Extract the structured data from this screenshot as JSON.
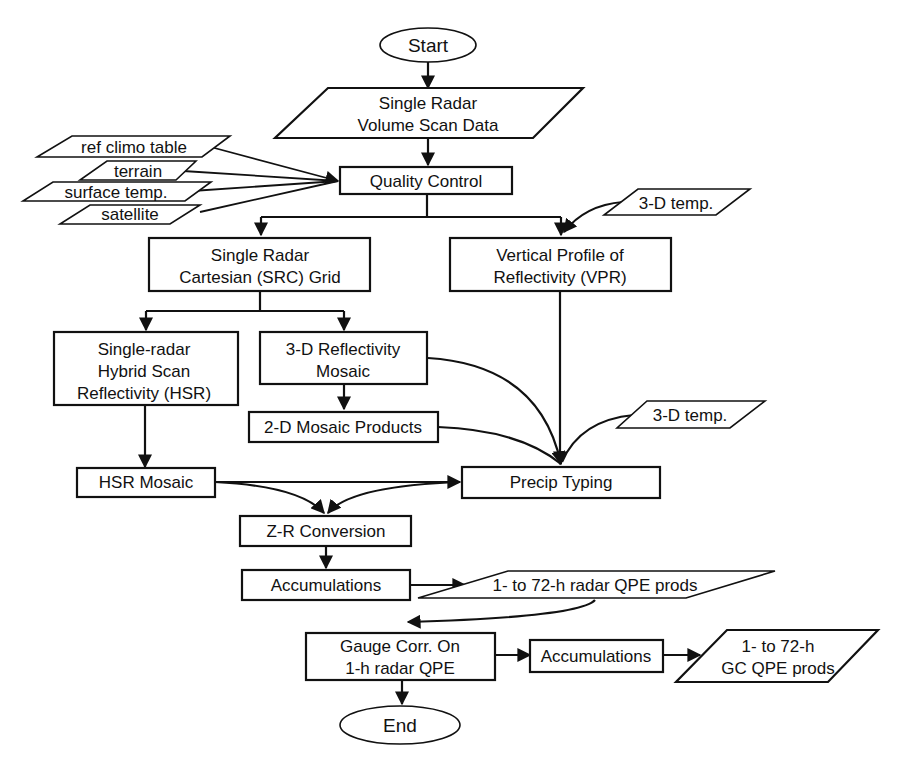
{
  "diagram": {
    "type": "flowchart",
    "nodes": {
      "start": {
        "label": "Start",
        "shape": "ellipse"
      },
      "volume_scan": {
        "line1": "Single Radar",
        "line2": "Volume Scan Data",
        "shape": "parallelogram"
      },
      "ref_climo": {
        "label": "ref climo table",
        "shape": "parallelogram"
      },
      "terrain": {
        "label": "terrain",
        "shape": "parallelogram"
      },
      "surface_temp": {
        "label": "surface temp.",
        "shape": "parallelogram"
      },
      "satellite": {
        "label": "satellite",
        "shape": "parallelogram"
      },
      "quality_control": {
        "label": "Quality Control",
        "shape": "rectangle"
      },
      "temp3d_a": {
        "label": "3-D temp.",
        "shape": "parallelogram"
      },
      "src_grid": {
        "line1": "Single Radar",
        "line2": "Cartesian (SRC) Grid",
        "shape": "rectangle"
      },
      "vpr": {
        "line1": "Vertical Profile of",
        "line2": "Reflectivity (VPR)",
        "shape": "rectangle"
      },
      "hsr": {
        "line1": "Single-radar",
        "line2": "Hybrid Scan",
        "line3": "Reflectivity (HSR)",
        "shape": "rectangle"
      },
      "refl3d": {
        "line1": "3-D Reflectivity",
        "line2": "Mosaic",
        "shape": "rectangle"
      },
      "mosaic2d": {
        "label": "2-D Mosaic Products",
        "shape": "rectangle"
      },
      "temp3d_b": {
        "label": "3-D temp.",
        "shape": "parallelogram"
      },
      "hsr_mosaic": {
        "label": "HSR Mosaic",
        "shape": "rectangle"
      },
      "precip_typing": {
        "label": "Precip Typing",
        "shape": "rectangle"
      },
      "zr_conversion": {
        "label": "Z-R Conversion",
        "shape": "rectangle"
      },
      "accum1": {
        "label": "Accumulations",
        "shape": "rectangle"
      },
      "radar_qpe": {
        "label": "1- to 72-h radar QPE prods",
        "shape": "parallelogram"
      },
      "gauge_corr": {
        "line1": "Gauge Corr. On",
        "line2": "1-h radar QPE",
        "shape": "rectangle"
      },
      "accum2": {
        "label": "Accumulations",
        "shape": "rectangle"
      },
      "gc_qpe": {
        "line1": "1- to 72-h",
        "line2": "GC QPE prods",
        "shape": "parallelogram"
      },
      "end": {
        "label": "End",
        "shape": "ellipse"
      }
    },
    "edges": [
      [
        "start",
        "volume_scan"
      ],
      [
        "volume_scan",
        "quality_control"
      ],
      [
        "ref_climo",
        "quality_control"
      ],
      [
        "terrain",
        "quality_control"
      ],
      [
        "surface_temp",
        "quality_control"
      ],
      [
        "satellite",
        "quality_control"
      ],
      [
        "quality_control",
        "src_grid"
      ],
      [
        "quality_control",
        "vpr"
      ],
      [
        "temp3d_a",
        "vpr"
      ],
      [
        "src_grid",
        "hsr"
      ],
      [
        "src_grid",
        "refl3d"
      ],
      [
        "refl3d",
        "mosaic2d"
      ],
      [
        "refl3d",
        "precip_typing"
      ],
      [
        "mosaic2d",
        "precip_typing"
      ],
      [
        "vpr",
        "precip_typing"
      ],
      [
        "temp3d_b",
        "precip_typing"
      ],
      [
        "hsr",
        "hsr_mosaic"
      ],
      [
        "hsr_mosaic",
        "precip_typing"
      ],
      [
        "hsr_mosaic",
        "zr_conversion"
      ],
      [
        "precip_typing",
        "zr_conversion"
      ],
      [
        "zr_conversion",
        "accum1"
      ],
      [
        "accum1",
        "radar_qpe"
      ],
      [
        "radar_qpe",
        "gauge_corr"
      ],
      [
        "gauge_corr",
        "accum2"
      ],
      [
        "accum2",
        "gc_qpe"
      ],
      [
        "gauge_corr",
        "end"
      ]
    ]
  }
}
